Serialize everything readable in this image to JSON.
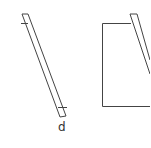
{
  "figure": {
    "left_panel": {
      "description": "slanted thin bar with end tick marks",
      "label": "d"
    },
    "right_panel": {
      "description": "square frame with slanted bar crossing its top-right corner"
    }
  },
  "colors": {
    "stroke": "#444444",
    "background": "#ffffff"
  }
}
